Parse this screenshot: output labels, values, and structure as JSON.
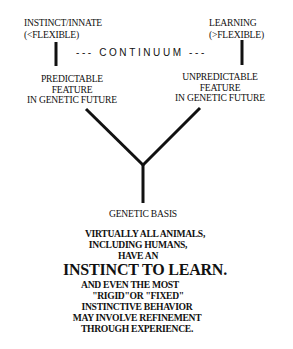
{
  "top": {
    "left_label": [
      "INSTINCT/INNATE",
      "(<FLEXIBLE)"
    ],
    "right_label": [
      "LEARNING",
      "(>FLEXIBLE)"
    ],
    "continuum": "--- CONTINUUM ---"
  },
  "middle": {
    "left_feature": [
      "PREDICTABLE",
      "FEATURE",
      "IN GENETIC FUTURE"
    ],
    "right_feature": [
      "UNPREDICTABLE",
      "FEATURE",
      "IN GENETIC FUTURE"
    ]
  },
  "bottom": {
    "genetic_basis": "GENETIC BASIS",
    "statement": {
      "line1": "VIRTUALLY ALL ANIMALS,",
      "line2": "INCLUDING HUMANS,",
      "line3": "HAVE AN",
      "headline": "INSTINCT TO LEARN.",
      "line5": "AND EVEN THE MOST",
      "line6": "\"RIGID\"OR \"FIXED\"",
      "line7": "INSTINCTIVE BEHAVIOR",
      "line8": "MAY INVOLVE REFINEMENT",
      "line9": "THROUGH EXPERIENCE."
    }
  },
  "colors": {
    "ink": "#111111",
    "background": "#ffffff"
  }
}
